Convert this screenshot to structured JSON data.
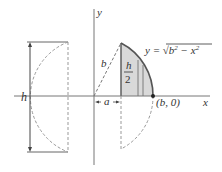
{
  "diagram": {
    "axes": {
      "x_label": "x",
      "y_label": "y"
    },
    "labels": {
      "h": "h",
      "b": "b",
      "a": "a",
      "h_half_num": "h",
      "h_half_den": "2",
      "point": "(b, 0)",
      "curve_lhs": "y = ",
      "curve_sqrt": "√",
      "curve_radicand_b": "b",
      "curve_exp1": "2",
      "curve_minus": " − x",
      "curve_exp2": "2"
    },
    "colors": {
      "axis": "#777777",
      "curve": "#555555",
      "shade": "#d9d9d9",
      "dashed": "#999999",
      "text": "#333333"
    }
  }
}
